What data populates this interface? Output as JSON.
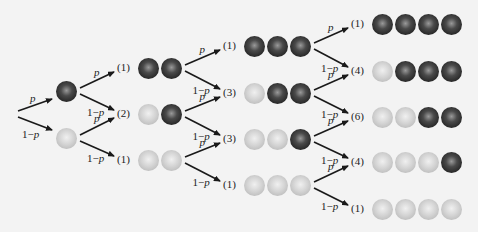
{
  "diagram": {
    "type": "probability-tree",
    "branch_labels": {
      "success": "p",
      "failure": "1−p"
    },
    "colors": {
      "dark_ball": "#2a2a2a",
      "light_ball": "#c8c8c8",
      "arrow": "#1a1a1a",
      "background": "#f3f3f3"
    },
    "stages": [
      {
        "n": 1,
        "outcomes": [
          {
            "count": "",
            "balls": [
              "dark"
            ]
          },
          {
            "count": "",
            "balls": [
              "light"
            ]
          }
        ]
      },
      {
        "n": 2,
        "outcomes": [
          {
            "count": "(1)",
            "balls": [
              "dark",
              "dark"
            ]
          },
          {
            "count": "(2)",
            "balls": [
              "light",
              "dark"
            ]
          },
          {
            "count": "(1)",
            "balls": [
              "light",
              "light"
            ]
          }
        ]
      },
      {
        "n": 3,
        "outcomes": [
          {
            "count": "(1)",
            "balls": [
              "dark",
              "dark",
              "dark"
            ]
          },
          {
            "count": "(3)",
            "balls": [
              "light",
              "dark",
              "dark"
            ]
          },
          {
            "count": "(3)",
            "balls": [
              "light",
              "light",
              "dark"
            ]
          },
          {
            "count": "(1)",
            "balls": [
              "light",
              "light",
              "light"
            ]
          }
        ]
      },
      {
        "n": 4,
        "outcomes": [
          {
            "count": "(1)",
            "balls": [
              "dark",
              "dark",
              "dark",
              "dark"
            ]
          },
          {
            "count": "(4)",
            "balls": [
              "light",
              "dark",
              "dark",
              "dark"
            ]
          },
          {
            "count": "(6)",
            "balls": [
              "light",
              "light",
              "dark",
              "dark"
            ]
          },
          {
            "count": "(4)",
            "balls": [
              "light",
              "light",
              "light",
              "dark"
            ]
          },
          {
            "count": "(1)",
            "balls": [
              "light",
              "light",
              "light",
              "light"
            ]
          }
        ]
      }
    ]
  }
}
